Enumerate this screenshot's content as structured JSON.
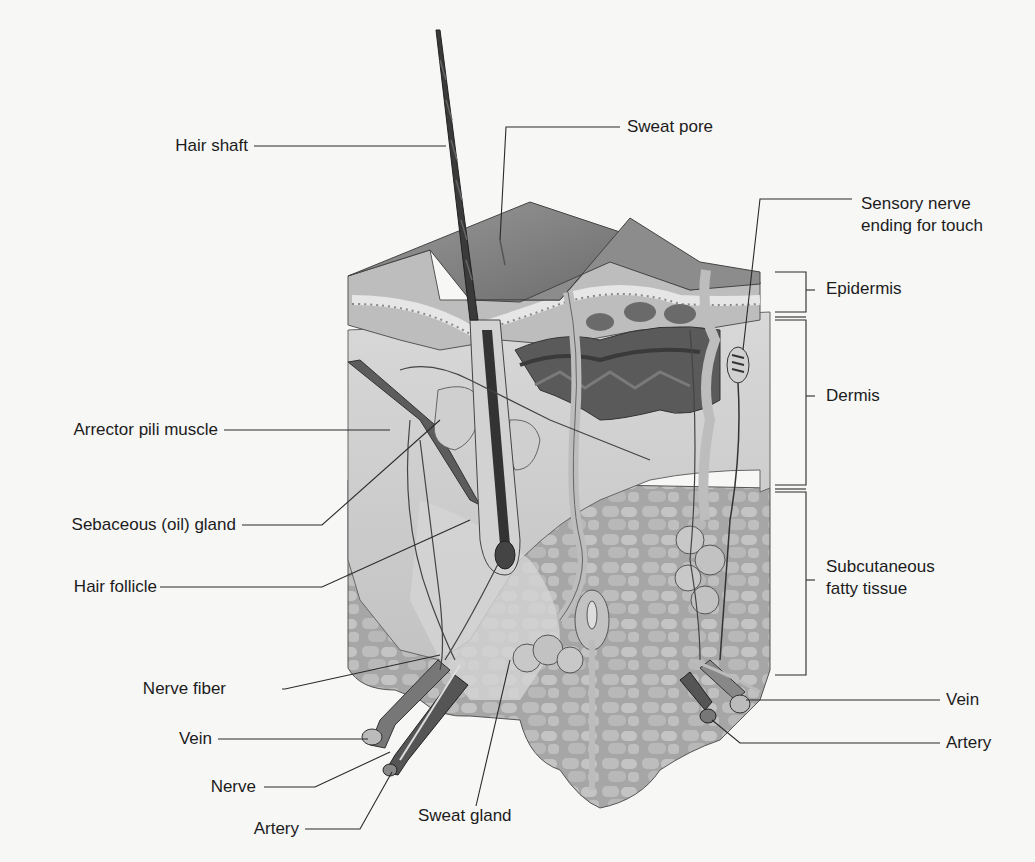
{
  "labels_left": [
    {
      "id": "hair-shaft",
      "text": "Hair shaft",
      "x": 248,
      "y": 146
    },
    {
      "id": "arrector-pili",
      "text": "Arrector pili muscle",
      "x": 218,
      "y": 430
    },
    {
      "id": "sebaceous",
      "text": "Sebaceous (oil) gland",
      "x": 236,
      "y": 525
    },
    {
      "id": "hair-follicle",
      "text": "Hair follicle",
      "x": 157,
      "y": 587
    },
    {
      "id": "nerve-fiber",
      "text": "Nerve fiber",
      "x": 226,
      "y": 689
    },
    {
      "id": "vein-left",
      "text": "Vein",
      "x": 212,
      "y": 739
    },
    {
      "id": "nerve",
      "text": "Nerve",
      "x": 256,
      "y": 787
    },
    {
      "id": "artery-left",
      "text": "Artery",
      "x": 299,
      "y": 829
    }
  ],
  "labels_right": [
    {
      "id": "sweat-pore",
      "text": "Sweat pore",
      "x": 627,
      "y": 127
    },
    {
      "id": "epidermis",
      "text": "Epidermis",
      "x": 826,
      "y": 289
    },
    {
      "id": "dermis",
      "text": "Dermis",
      "x": 826,
      "y": 396
    },
    {
      "id": "vein-right",
      "text": "Vein",
      "x": 946,
      "y": 700
    },
    {
      "id": "artery-right",
      "text": "Artery",
      "x": 946,
      "y": 743
    }
  ],
  "labels_multiline": [
    {
      "id": "sensory-nerve",
      "lines": [
        "Sensory nerve",
        "ending for touch"
      ],
      "x": 861,
      "y": 194
    },
    {
      "id": "subcutaneous",
      "lines": [
        "Subcutaneous",
        "fatty tissue"
      ],
      "x": 826,
      "y": 556
    }
  ],
  "sweat_gland_label": {
    "text": "Sweat gland",
    "x": 418,
    "y": 816
  },
  "colors": {
    "background": "#f7f7f6",
    "line": "#2a2a2a",
    "epidermis": "#8a8a8a",
    "dermis": "#c8c8c8",
    "fat": "#a9a9a9",
    "hair": "#3a3a3a",
    "vessel": "#6e6e6e"
  }
}
